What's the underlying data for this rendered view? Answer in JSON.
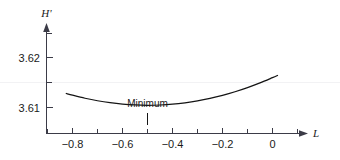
{
  "chart_data": {
    "type": "line",
    "title": "",
    "subtitle": "",
    "xlabel": "L",
    "ylabel": "H'",
    "xlim": [
      -0.92,
      0.06
    ],
    "ylim": [
      3.6045,
      3.6255
    ],
    "grid": false,
    "legend": null,
    "x_ticks_major": [
      -0.8,
      -0.6,
      -0.4,
      -0.2,
      0
    ],
    "x_tick_labels": [
      "−0.8",
      "−0.6",
      "−0.4",
      "−0.2",
      "0"
    ],
    "x_ticks_minor": [
      -0.9,
      -0.7,
      -0.5,
      -0.3,
      -0.1
    ],
    "y_ticks_major": [
      3.61,
      3.62
    ],
    "y_tick_labels": [
      "3.61",
      "3.62"
    ],
    "y_ticks_minor": [
      3.615
    ],
    "series": [
      {
        "name": "H' versus L",
        "x": [
          -0.825,
          -0.8,
          -0.75,
          -0.7,
          -0.65,
          -0.6,
          -0.55,
          -0.5,
          -0.45,
          -0.4,
          -0.35,
          -0.3,
          -0.25,
          -0.2,
          -0.15,
          -0.1,
          -0.05,
          0.0,
          0.02
        ],
        "y": [
          3.6128,
          3.61246,
          3.61185,
          3.61135,
          3.61096,
          3.61068,
          3.61051,
          3.61045,
          3.6105,
          3.61066,
          3.61094,
          3.61132,
          3.61182,
          3.61243,
          3.61315,
          3.61398,
          3.61492,
          3.61597,
          3.61641
        ]
      }
    ],
    "annotations": [
      {
        "text": "Minimum",
        "x": -0.5,
        "y": 3.61045,
        "pointer": "vertical-tick-below-label"
      }
    ]
  },
  "axes": {
    "y_axis_label": "H'",
    "x_axis_label": "L"
  },
  "colors": {
    "curve": "#141414",
    "axis": "#3b3b47",
    "text": "#1a1a1a",
    "background": "#ffffff"
  }
}
